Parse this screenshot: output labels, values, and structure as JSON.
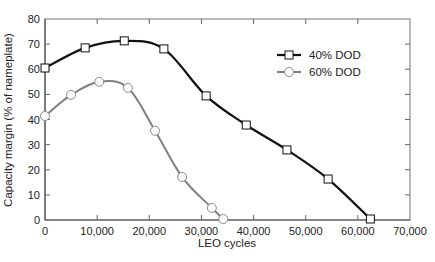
{
  "chart_data": {
    "type": "line",
    "title": "",
    "xlabel": "LEO cycles",
    "ylabel": "Capacity margin (% of nameplate)",
    "xlim": [
      0,
      70000
    ],
    "ylim": [
      0,
      80
    ],
    "xticks": [
      0,
      10000,
      20000,
      30000,
      40000,
      50000,
      60000,
      70000
    ],
    "xtick_labels": [
      "0",
      "10,000",
      "20,000",
      "30,000",
      "40,000",
      "50,000",
      "60,000",
      "70,000"
    ],
    "yticks": [
      0,
      10,
      20,
      30,
      40,
      50,
      60,
      70,
      80
    ],
    "ytick_labels": [
      "0",
      "10",
      "20",
      "30",
      "40",
      "50",
      "60",
      "70",
      "80"
    ],
    "grid": false,
    "legend_position": "upper right",
    "series": [
      {
        "name": "40% DOD",
        "marker": "square",
        "color": "#111111",
        "x": [
          0,
          7700,
          15200,
          22800,
          30900,
          38600,
          46400,
          54300,
          62400
        ],
        "y": [
          60.5,
          68.5,
          71.3,
          68.1,
          49.4,
          37.8,
          27.9,
          16.3,
          0.4
        ]
      },
      {
        "name": "60% DOD",
        "marker": "circle",
        "color": "#808080",
        "x": [
          0,
          5000,
          10400,
          15900,
          21100,
          26300,
          32000,
          34200
        ],
        "y": [
          41.4,
          49.8,
          55.0,
          52.6,
          35.5,
          17.1,
          4.8,
          0.4
        ]
      }
    ]
  }
}
